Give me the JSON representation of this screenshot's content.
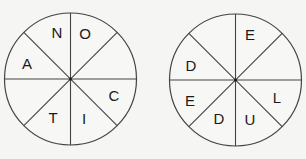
{
  "puzzle": {
    "wheels": [
      {
        "id": "left",
        "cx": 70.5,
        "cy": 79,
        "r": 66,
        "segments": [
          {
            "position": "top-left-upper",
            "letter": "N",
            "x": 57,
            "y": 32
          },
          {
            "position": "top-right-upper",
            "letter": "O",
            "x": 85,
            "y": 33
          },
          {
            "position": "right-upper",
            "letter": "",
            "x": 0,
            "y": 0
          },
          {
            "position": "right-lower",
            "letter": "C",
            "x": 114,
            "y": 95
          },
          {
            "position": "bottom-right-lower",
            "letter": "I",
            "x": 84,
            "y": 118
          },
          {
            "position": "bottom-left-lower",
            "letter": "T",
            "x": 53,
            "y": 117
          },
          {
            "position": "left-lower",
            "letter": "",
            "x": 0,
            "y": 0
          },
          {
            "position": "left-upper",
            "letter": "A",
            "x": 27,
            "y": 63
          }
        ]
      },
      {
        "id": "right",
        "cx": 235.5,
        "cy": 80,
        "r": 66,
        "segments": [
          {
            "position": "top-left-upper",
            "letter": "",
            "x": 0,
            "y": 0
          },
          {
            "position": "top-right-upper",
            "letter": "E",
            "x": 250,
            "y": 34
          },
          {
            "position": "right-upper",
            "letter": "",
            "x": 0,
            "y": 0
          },
          {
            "position": "right-lower",
            "letter": "L",
            "x": 277,
            "y": 97
          },
          {
            "position": "bottom-right-lower",
            "letter": "U",
            "x": 250,
            "y": 119
          },
          {
            "position": "bottom-left-lower",
            "letter": "D",
            "x": 219,
            "y": 118
          },
          {
            "position": "left-lower",
            "letter": "E",
            "x": 190,
            "y": 100
          },
          {
            "position": "left-upper",
            "letter": "D",
            "x": 191,
            "y": 65
          }
        ]
      }
    ],
    "colors": {
      "background": "#f5f5f3",
      "line": "#444444",
      "text": "#1a1a1a"
    }
  }
}
